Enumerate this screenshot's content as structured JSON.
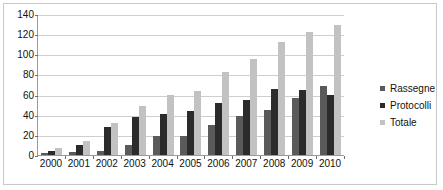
{
  "chart_data": {
    "type": "bar",
    "title": "",
    "subtitle": "",
    "xlabel": "",
    "ylabel": "",
    "categories": [
      "2000",
      "2001",
      "2002",
      "2003",
      "2004",
      "2005",
      "2006",
      "2007",
      "2008",
      "2009",
      "2010"
    ],
    "series": [
      {
        "name": "Rassegne",
        "color": "#5a5a5a",
        "values": [
          2,
          3,
          4,
          10,
          19,
          19,
          30,
          39,
          45,
          57,
          69
        ]
      },
      {
        "name": "Protocolli",
        "color": "#2b2b2b",
        "values": [
          4,
          10,
          28,
          38,
          41,
          44,
          52,
          55,
          66,
          65,
          60
        ]
      },
      {
        "name": "Totale",
        "color": "#c2c2c2",
        "values": [
          7,
          14,
          32,
          49,
          60,
          64,
          82,
          95,
          112,
          122,
          129
        ]
      }
    ],
    "ylim": [
      0,
      140
    ],
    "ytick_step": 20,
    "yticks": [
      "0",
      "20",
      "40",
      "60",
      "80",
      "100",
      "120",
      "140"
    ],
    "grid": true,
    "legend_position": "right",
    "axis_color": "#9a9a9a",
    "gridline_color": "#cfcfcf",
    "background": "#ffffff",
    "border_color": "#c8c8c8"
  },
  "legend": {
    "entries": [
      {
        "label": "Rassegne"
      },
      {
        "label": "Protocolli"
      },
      {
        "label": "Totale"
      }
    ]
  }
}
